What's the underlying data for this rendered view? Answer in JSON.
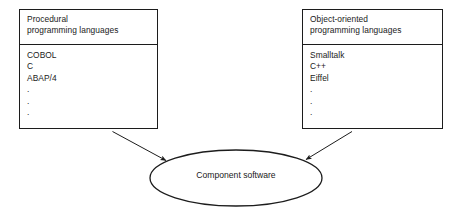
{
  "diagram": {
    "title": "Component software",
    "background_color": "#ffffff",
    "stroke_color": "#1c1c1c",
    "text_color": "#1a1a1a",
    "nodes": {
      "procedural": {
        "header_line_1": "Procedural",
        "header_line_2": "programming languages",
        "items": [
          "COBOL",
          "C",
          "ABAP/4"
        ],
        "continuation": [
          ".",
          ".",
          "."
        ]
      },
      "object_oriented": {
        "header_line_1": "Object-oriented",
        "header_line_2": "programming languages",
        "items": [
          "Smalltalk",
          "C++",
          "Eiffel"
        ],
        "continuation": [
          ".",
          ".",
          "."
        ]
      },
      "component": {
        "label": "Component software"
      }
    },
    "edges": [
      {
        "name": "procedural-to-component",
        "from": "procedural",
        "to": "component",
        "arrowhead": "filled-triangle"
      },
      {
        "name": "object-oriented-to-component",
        "from": "object_oriented",
        "to": "component",
        "arrowhead": "filled-triangle"
      }
    ]
  }
}
